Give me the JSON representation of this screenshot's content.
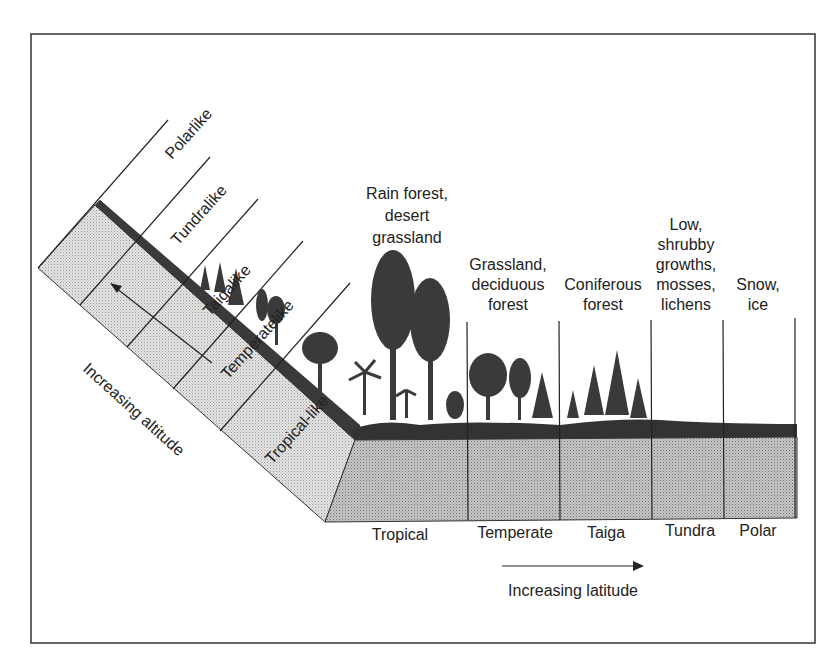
{
  "diagram": {
    "altitude_zones": [
      "Polarlike",
      "Tundralike",
      "Taigalike",
      "Temperatelike",
      "Tropical-like"
    ],
    "altitude_axis_label": "Increasing altitude",
    "latitude_axis_label": "Increasing latitude",
    "latitude_zones": [
      {
        "name": "Tropical",
        "vegetation": [
          "Rain forest,",
          "desert",
          "grassland"
        ]
      },
      {
        "name": "Temperate",
        "vegetation": [
          "Grassland,",
          "deciduous",
          "forest"
        ]
      },
      {
        "name": "Taiga",
        "vegetation": [
          "Coniferous",
          "forest"
        ]
      },
      {
        "name": "Tundra",
        "vegetation": [
          "Low,",
          "shrubby",
          "growths,",
          "mosses,",
          "lichens"
        ]
      },
      {
        "name": "Polar",
        "vegetation": [
          "Snow,",
          "ice"
        ]
      }
    ]
  }
}
